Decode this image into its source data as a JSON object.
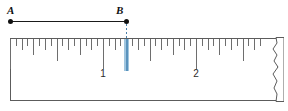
{
  "figure": {
    "type": "ruler-measurement-diagram"
  },
  "segment": {
    "name": "AB",
    "endpoints": [
      {
        "label": "A",
        "x": 10,
        "y": 21
      },
      {
        "label": "B",
        "x": 126,
        "y": 21
      }
    ],
    "line_color": "#1a1a1a",
    "point_color": "#111111"
  },
  "ruler": {
    "left": 10,
    "right": 278,
    "top": 38,
    "bottom": 101,
    "border_color": "#5c5c5c",
    "tick_color": "#6e6e6e",
    "unit": "inch",
    "pixels_per_inch": 93,
    "origin_x": 10,
    "subdivisions_per_inch": 16,
    "torn_right_edge": true,
    "number_labels": [
      {
        "text": "1",
        "inch": 1,
        "x": 103,
        "y": 69
      },
      {
        "text": "2",
        "inch": 2,
        "x": 196,
        "y": 69
      }
    ],
    "tick_lengths": {
      "inch": 30,
      "half": 22,
      "quarter": 16,
      "eighth": 11,
      "sixteenth": 7
    }
  },
  "highlight": {
    "at_inch": 1.25,
    "x": 126,
    "band_color": "#9cc3dd",
    "core_color": "#5a93bd",
    "dash_color": "#4a7fa8",
    "top": 24,
    "bottom": 70
  },
  "chart_data": {
    "type": "table",
    "categories": [
      "A",
      "B"
    ],
    "values": [
      0,
      1.25
    ],
    "xlabel": "inches",
    "ylabel": "",
    "xlim": [
      0,
      2.88
    ],
    "annotations": [
      "Segment endpoint A sits at the 0 mark of the ruler.",
      "Segment endpoint B sits at the highlighted tick, 1 1/4 inches.",
      "Labeled inch marks shown: 1 and 2.",
      "Ruler right end is torn/broken."
    ]
  }
}
